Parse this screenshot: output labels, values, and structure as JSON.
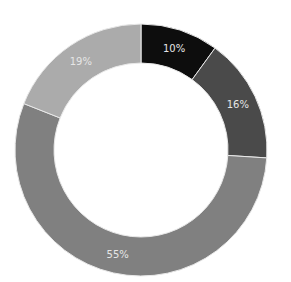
{
  "chart_data": {
    "type": "pie",
    "variant": "donut",
    "title": "",
    "categories": [
      "Segment 1",
      "Segment 2",
      "Segment 3",
      "Segment 4"
    ],
    "values": [
      10,
      16,
      55,
      19
    ],
    "labels": [
      "10%",
      "16%",
      "55%",
      "19%"
    ],
    "colors": [
      "#0d0d0d",
      "#4a4a4a",
      "#808080",
      "#ababab"
    ],
    "start_angle": "12 o'clock",
    "direction": "clockwise",
    "legend": "none"
  },
  "layout": {
    "cx": 141,
    "cy": 150,
    "outer_r": 126,
    "inner_r": 87,
    "label_r": 107,
    "separator_color": "#e8e8e8"
  }
}
